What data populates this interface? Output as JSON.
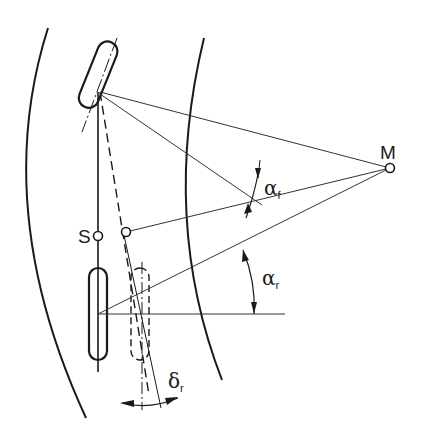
{
  "diagram": {
    "title": "",
    "labels": {
      "center_of_curvature": "M",
      "center_of_gravity": "S",
      "alpha_front": {
        "symbol": "α",
        "subscript": "f"
      },
      "alpha_rear": {
        "symbol": "α",
        "subscript": "r"
      },
      "delta_rear": {
        "symbol": "δ",
        "subscript": "r"
      }
    },
    "colors": {
      "line": "#1a1a1a",
      "thin_line": "#444444",
      "background": "#ffffff"
    }
  }
}
